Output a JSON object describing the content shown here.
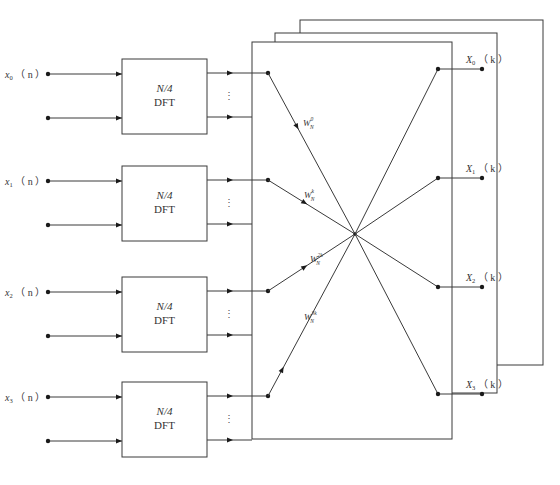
{
  "diagram": {
    "type": "radix-4 decimation-in-time FFT butterfly structure",
    "inputs": [
      {
        "var": "x",
        "sub": "0",
        "arg": "（ n ）"
      },
      {
        "var": "x",
        "sub": "1",
        "arg": "（ n ）"
      },
      {
        "var": "x",
        "sub": "2",
        "arg": "（ n ）"
      },
      {
        "var": "x",
        "sub": "3",
        "arg": "（ n ）"
      }
    ],
    "blocks": [
      {
        "line1": "N/4",
        "line2": "DFT"
      },
      {
        "line1": "N/4",
        "line2": "DFT"
      },
      {
        "line1": "N/4",
        "line2": "DFT"
      },
      {
        "line1": "N/4",
        "line2": "DFT"
      }
    ],
    "ellipsis": "⋮",
    "twiddles": [
      {
        "base": "W",
        "sub": "N",
        "sup": "0"
      },
      {
        "base": "W",
        "sub": "N",
        "sup": "k"
      },
      {
        "base": "W",
        "sub": "N",
        "sup": "2k"
      },
      {
        "base": "W",
        "sub": "N",
        "sup": "3k"
      }
    ],
    "outputs": [
      {
        "var": "X",
        "sub": "0",
        "arg": "（ k ）"
      },
      {
        "var": "X",
        "sub": "1",
        "arg": "（ k ）"
      },
      {
        "var": "X",
        "sub": "2",
        "arg": "（ k ）"
      },
      {
        "var": "X",
        "sub": "3",
        "arg": "（ k ）"
      }
    ],
    "stacked_pages": 3
  }
}
